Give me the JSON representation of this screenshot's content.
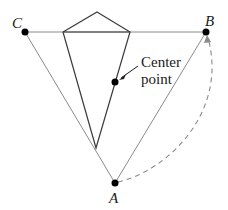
{
  "diagram": {
    "points": {
      "A": {
        "label": "A",
        "x": 115,
        "y": 183
      },
      "B": {
        "label": "B",
        "x": 206,
        "y": 32
      },
      "C": {
        "label": "C",
        "x": 25,
        "y": 32
      }
    },
    "center_point": {
      "label_line1": "Center",
      "label_line2": "point",
      "x": 115,
      "y": 82
    },
    "kite": {
      "apex": [
        97,
        12
      ],
      "left": [
        63,
        32
      ],
      "right": [
        130,
        32
      ],
      "bottom": [
        96,
        148
      ]
    },
    "colors": {
      "triangle_stroke": "#8a8a8a",
      "kite_stroke": "#3a3a3a",
      "dot_fill": "#000000",
      "arc_stroke": "#8a8a8a"
    }
  }
}
